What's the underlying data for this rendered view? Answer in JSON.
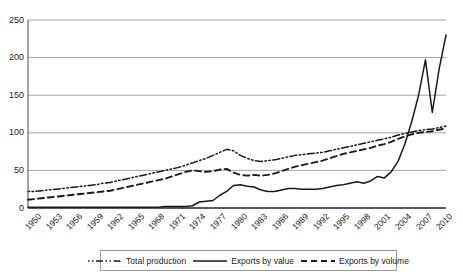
{
  "chart_data": {
    "type": "line",
    "title": "",
    "xlabel": "",
    "ylabel": "",
    "ylim": [
      0,
      250
    ],
    "yticks": [
      0,
      50,
      100,
      150,
      200,
      250
    ],
    "xlim": [
      1950,
      2011
    ],
    "xticks": [
      1950,
      1953,
      1956,
      1959,
      1962,
      1965,
      1968,
      1971,
      1974,
      1977,
      1980,
      1983,
      1986,
      1989,
      1992,
      1995,
      1998,
      2001,
      2004,
      2007,
      2010
    ],
    "grid": true,
    "legend_position": "bottom",
    "x": [
      1950,
      1951,
      1952,
      1953,
      1954,
      1955,
      1956,
      1957,
      1958,
      1959,
      1960,
      1961,
      1962,
      1963,
      1964,
      1965,
      1966,
      1967,
      1968,
      1969,
      1970,
      1971,
      1972,
      1973,
      1974,
      1975,
      1976,
      1977,
      1978,
      1979,
      1980,
      1981,
      1982,
      1983,
      1984,
      1985,
      1986,
      1987,
      1988,
      1989,
      1990,
      1991,
      1992,
      1993,
      1994,
      1995,
      1996,
      1997,
      1998,
      1999,
      2000,
      2001,
      2002,
      2003,
      2004,
      2005,
      2006,
      2007,
      2008,
      2009,
      2010,
      2011
    ],
    "series": [
      {
        "name": "Total production",
        "style": "dash-dot-dot",
        "color": "#1a1a1a",
        "values": [
          22,
          22,
          23,
          24,
          25,
          26,
          27,
          28,
          29,
          30,
          31,
          33,
          34,
          36,
          38,
          40,
          42,
          44,
          46,
          48,
          50,
          52,
          54,
          57,
          60,
          63,
          66,
          70,
          74,
          78,
          76,
          70,
          66,
          63,
          62,
          63,
          64,
          66,
          68,
          70,
          71,
          72,
          73,
          74,
          76,
          78,
          80,
          82,
          84,
          86,
          88,
          90,
          92,
          94,
          97,
          99,
          101,
          103,
          104,
          105,
          107,
          109
        ]
      },
      {
        "name": "Exports by value",
        "style": "solid",
        "color": "#1a1a1a",
        "values": [
          1,
          1,
          1,
          1,
          1,
          1,
          1,
          1,
          1,
          1,
          1,
          1,
          1,
          1,
          1,
          1,
          1,
          1,
          1,
          1,
          2,
          2,
          2,
          2,
          3,
          8,
          9,
          10,
          17,
          22,
          30,
          31,
          29,
          28,
          24,
          22,
          22,
          24,
          26,
          26,
          25,
          25,
          25,
          26,
          28,
          30,
          31,
          33,
          35,
          33,
          36,
          42,
          40,
          48,
          62,
          85,
          115,
          150,
          197,
          127,
          185,
          230
        ]
      },
      {
        "name": "Exports by volume",
        "style": "dashed",
        "color": "#1a1a1a",
        "values": [
          11,
          12,
          13,
          14,
          15,
          16,
          17,
          18,
          19,
          20,
          21,
          22,
          23,
          25,
          27,
          29,
          31,
          33,
          35,
          37,
          39,
          42,
          45,
          48,
          50,
          49,
          48,
          49,
          51,
          52,
          47,
          44,
          43,
          44,
          43,
          44,
          46,
          49,
          52,
          55,
          57,
          59,
          61,
          63,
          66,
          69,
          72,
          74,
          76,
          78,
          80,
          83,
          85,
          88,
          92,
          95,
          98,
          100,
          101,
          102,
          104,
          106
        ]
      }
    ]
  },
  "legend": {
    "items": [
      {
        "label": "Total production"
      },
      {
        "label": "Exports by value"
      },
      {
        "label": "Exports by volume"
      }
    ]
  }
}
